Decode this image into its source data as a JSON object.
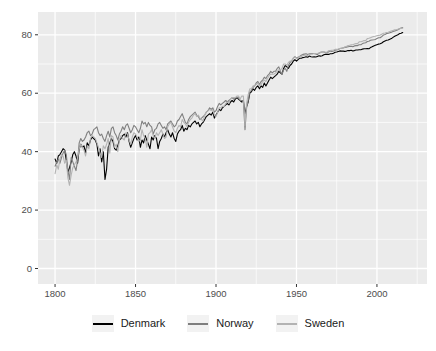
{
  "chart_data": {
    "type": "line",
    "title": "",
    "xlabel": "",
    "ylabel": "",
    "x_ticks": [
      1800,
      1850,
      1900,
      1950,
      2000
    ],
    "x_minor_ticks": [
      1825,
      1875,
      1925,
      1975,
      2025
    ],
    "y_ticks": [
      0,
      20,
      40,
      60,
      80
    ],
    "y_minor_ticks": [
      10,
      30,
      50,
      70
    ],
    "xlim": [
      1789.4,
      2031.1
    ],
    "ylim": [
      -5.3,
      87.8
    ],
    "grid": true,
    "legend_position": "bottom",
    "panel_background": "#EBEBEB",
    "gridline_color": "#FFFFFF",
    "tick_mark_color": "#333333",
    "tick_label_color": "#4D4D4D",
    "x_start": 1800,
    "x_step": 1,
    "series": [
      {
        "name": "Denmark",
        "color": "#000000",
        "values": [
          37.5,
          36,
          38.5,
          39,
          40,
          41,
          40.5,
          37,
          33,
          34.5,
          36.5,
          39,
          40,
          38.5,
          36,
          41,
          42.5,
          41.5,
          42,
          39.5,
          43,
          42,
          44,
          45,
          44.5,
          44,
          42.5,
          38.5,
          41,
          36.5,
          40,
          30.5,
          34,
          41.5,
          43,
          44.5,
          43.5,
          41,
          40.5,
          42,
          44,
          44.5,
          45.5,
          46,
          45,
          46.5,
          43.5,
          41.5,
          43,
          44.5,
          45.5,
          44,
          45,
          41.5,
          44,
          43,
          45.5,
          44,
          42.5,
          41,
          45,
          44,
          45.5,
          44.5,
          41,
          43.5,
          44.5,
          46,
          45,
          46.5,
          47.5,
          46,
          45,
          46.5,
          44.5,
          43.5,
          46,
          47,
          47.5,
          49,
          47,
          48,
          47.5,
          49,
          48.5,
          49.5,
          50,
          50.5,
          49.5,
          50,
          48.5,
          49.5,
          50,
          51,
          52,
          52.5,
          53,
          52.5,
          53.5,
          51.5,
          52.5,
          53.5,
          54.5,
          54,
          55,
          55.5,
          56,
          56.5,
          56,
          57,
          57.5,
          57,
          58,
          58.5,
          58,
          57.5,
          57,
          57.5,
          53,
          55.5,
          57,
          60,
          60.5,
          61.5,
          61,
          62,
          62.5,
          61.5,
          62.5,
          62,
          63.5,
          62.5,
          63.5,
          64.5,
          65.5,
          65,
          65.5,
          66,
          66.5,
          67.5,
          67,
          66.5,
          68.5,
          69.5,
          69,
          68.5,
          69.5,
          70,
          71,
          71.5,
          71,
          71.5,
          72,
          72,
          72.2,
          72.3,
          72.5,
          72.3,
          72.7,
          72.5,
          72.4,
          72.5,
          72.4,
          72.6,
          72.8,
          72.7,
          72.8,
          73.2,
          73.3,
          73.3,
          73.3,
          73.5,
          73.5,
          73.7,
          74,
          74.1,
          74.3,
          74.5,
          74.4,
          74.4,
          74.3,
          74.4,
          74.6,
          74.6,
          74.7,
          74.5,
          74.6,
          74.8,
          74.8,
          74.9,
          74.9,
          75.1,
          75.2,
          75.2,
          75.3,
          75.2,
          75.6,
          75.9,
          76.2,
          76.4,
          76.6,
          76.8,
          76.9,
          77.2,
          77.6,
          77.9,
          78.1,
          78.2,
          78.5,
          78.7,
          79.1,
          79.5,
          79.8,
          80,
          80.4,
          80.5,
          80.8
        ]
      },
      {
        "name": "Norway",
        "color": "#7F7F7F",
        "values": [
          35,
          36.5,
          37.5,
          36,
          38,
          39.5,
          40.5,
          39,
          33.5,
          30.5,
          38,
          36.5,
          35,
          33.5,
          37,
          43,
          44.5,
          43.5,
          44,
          45,
          46.5,
          47,
          45.5,
          46,
          47.5,
          48,
          48.5,
          46.5,
          45.5,
          46,
          44.5,
          43.5,
          45.5,
          47,
          45,
          48,
          48.5,
          46.5,
          45.5,
          44,
          46,
          47,
          48.5,
          47.5,
          49,
          49.5,
          48,
          46.5,
          47.5,
          49,
          48.5,
          47.5,
          46.5,
          48,
          50.5,
          49.5,
          50,
          48.5,
          50,
          49,
          48.5,
          46,
          47.5,
          48,
          49.5,
          50,
          49,
          48,
          48.5,
          47.5,
          49.5,
          50,
          50.5,
          49.5,
          48.5,
          49,
          50.5,
          51,
          52,
          53,
          51.5,
          50,
          49.5,
          51,
          52,
          52.5,
          53,
          53.5,
          52.5,
          52,
          51,
          51.5,
          52,
          52.5,
          53.5,
          54,
          55,
          54.5,
          55,
          53.5,
          54,
          55.5,
          56.5,
          56,
          56.5,
          57,
          57.5,
          57,
          57.5,
          58,
          58.5,
          58,
          58.5,
          58.5,
          58.5,
          57.5,
          57.5,
          57,
          47.5,
          55,
          57.5,
          60.5,
          61,
          62,
          62.5,
          63.5,
          64,
          63,
          64,
          64.5,
          65.5,
          65,
          66,
          66.5,
          67.5,
          67,
          67.5,
          67.5,
          68.5,
          69,
          67.5,
          66.5,
          68,
          68.5,
          67.5,
          69.5,
          70.5,
          71,
          72,
          72.5,
          72,
          72.3,
          72.6,
          73,
          73.3,
          73.4,
          73.5,
          73.3,
          73.5,
          73.6,
          73.6,
          73.6,
          73.4,
          73.2,
          73.7,
          74,
          74.1,
          74.1,
          73.9,
          73.8,
          74.2,
          74.4,
          74.3,
          74.5,
          74.7,
          74.8,
          75,
          75.3,
          75.4,
          75.5,
          75.7,
          75.8,
          75.9,
          76,
          76.1,
          75.9,
          76.2,
          76.3,
          76.3,
          76.6,
          76.6,
          77,
          77.2,
          77.3,
          77.7,
          77.8,
          78.1,
          78.2,
          78.3,
          78.4,
          78.7,
          79,
          79,
          79.4,
          79.9,
          80.1,
          80.4,
          80.5,
          80.7,
          80.9,
          81.1,
          81.3,
          81.5,
          81.7,
          82.1,
          82.3,
          82.5
        ]
      },
      {
        "name": "Sweden",
        "color": "#B3B3B3",
        "values": [
          32.5,
          35.5,
          34,
          37.5,
          39,
          38.5,
          36,
          37,
          31,
          28.5,
          32,
          34.5,
          35.5,
          36.5,
          38,
          41,
          42.5,
          41.5,
          40.5,
          38.5,
          42,
          41,
          44.5,
          45.5,
          45,
          44.5,
          43,
          41.5,
          39.5,
          38,
          42,
          41,
          42.5,
          44.5,
          39.5,
          45.5,
          45,
          41.5,
          42.5,
          40,
          44,
          45.5,
          44.5,
          44,
          46.5,
          46,
          44,
          42.5,
          45,
          46.5,
          46,
          45,
          43.5,
          44,
          47.5,
          45.5,
          44.5,
          41.5,
          46,
          46.5,
          47.5,
          45.5,
          44.5,
          46.5,
          45.5,
          46.5,
          47.5,
          46,
          44.5,
          45,
          48.5,
          49.5,
          50,
          48.5,
          47,
          46.5,
          48,
          49,
          48.5,
          51,
          50,
          49.5,
          48.5,
          50,
          51,
          51.5,
          52.5,
          53,
          52,
          52.5,
          51.5,
          51,
          50.5,
          52.5,
          53.5,
          54,
          54.5,
          54,
          54.5,
          52.5,
          52,
          53.5,
          55,
          55,
          55.5,
          55.5,
          56.5,
          57,
          56.5,
          58,
          58.5,
          58.5,
          58.5,
          59,
          59,
          58,
          59,
          59,
          49,
          56.5,
          59.5,
          61.5,
          61.5,
          62.5,
          62.5,
          63,
          63.5,
          62.5,
          63,
          64,
          64.5,
          64,
          65,
          66,
          66.5,
          66.5,
          66.5,
          67,
          67.5,
          68,
          68,
          68.5,
          70,
          70,
          69.5,
          70.5,
          71,
          71,
          72,
          72.5,
          71.8,
          72.1,
          72.5,
          72.6,
          72.8,
          73,
          73,
          72.9,
          73.3,
          73.4,
          73.4,
          73.6,
          73.5,
          73.6,
          73.8,
          73.9,
          74.2,
          74.2,
          74,
          74.1,
          74.6,
          74.6,
          74.7,
          74.8,
          75,
          75,
          75.1,
          75.3,
          75.4,
          75.5,
          75.8,
          76,
          76.3,
          76.4,
          76.6,
          76.6,
          76.8,
          77,
          77,
          77.6,
          77.6,
          77.8,
          78,
          78,
          78.7,
          78.8,
          79,
          79.2,
          79.4,
          79.5,
          79.7,
          79.8,
          79.9,
          80.2,
          80.5,
          80.6,
          80.8,
          80.9,
          81.1,
          81.3,
          81.5,
          81.7,
          81.7,
          81.9,
          82.1,
          82.2,
          82.3
        ]
      }
    ]
  },
  "legend": {
    "items": [
      "Denmark",
      "Norway",
      "Sweden"
    ]
  }
}
